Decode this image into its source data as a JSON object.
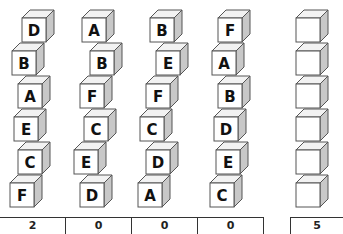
{
  "puzzle": {
    "stacks": [
      {
        "letters": [
          "D",
          "B",
          "A",
          "E",
          "C",
          "F"
        ]
      },
      {
        "letters": [
          "A",
          "B",
          "F",
          "C",
          "E",
          "D"
        ]
      },
      {
        "letters": [
          "B",
          "E",
          "F",
          "C",
          "D",
          "A"
        ]
      },
      {
        "letters": [
          "F",
          "A",
          "B",
          "D",
          "E",
          "C"
        ]
      }
    ],
    "answer_stack": {
      "letters": [
        "",
        "",
        "",
        "",
        "",
        ""
      ]
    },
    "scores": [
      "2",
      "0",
      "0",
      "0"
    ],
    "answer_score": "5"
  },
  "colors": {
    "cube_front": "#ffffff",
    "cube_top": "#f2f2f2",
    "cube_side": "#c8c8c8",
    "outline": "#555555",
    "letter": "#111111"
  }
}
